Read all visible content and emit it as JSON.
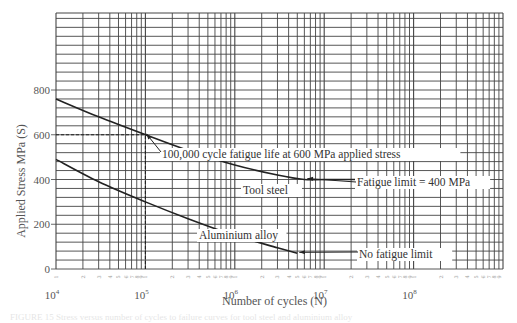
{
  "chart_data": {
    "type": "line",
    "title": "",
    "xlabel": "Number of cycles (N)",
    "ylabel": "Applied Stress MPa (S)",
    "x_scale": "log",
    "xlim": [
      10000,
      1000000000
    ],
    "ylim": [
      0,
      1140
    ],
    "grid": true,
    "x_tick_labels": [
      "10⁴",
      "10⁵",
      "10⁶",
      "10⁷",
      "10⁸"
    ],
    "x_tick_values": [
      10000,
      100000,
      1000000,
      10000000,
      100000000
    ],
    "y_tick_labels": [
      "0",
      "200",
      "400",
      "600",
      "800"
    ],
    "y_tick_values": [
      0,
      200,
      400,
      600,
      800
    ],
    "legend": null,
    "series": [
      {
        "name": "Tool steel",
        "x": [
          10000,
          30000,
          100000,
          300000,
          1000000,
          3000000,
          6000000,
          10000000,
          30000000,
          100000000,
          130000000
        ],
        "y": [
          760,
          680,
          600,
          530,
          465,
          420,
          400,
          400,
          400,
          400,
          400
        ]
      },
      {
        "name": "Aluminium alloy",
        "x": [
          10000,
          30000,
          100000,
          300000,
          1000000,
          3000000,
          5000000
        ],
        "y": [
          490,
          390,
          300,
          225,
          150,
          95,
          70
        ]
      }
    ],
    "annotations": [
      {
        "text": "100,000 cycle fatigue life at 600 MPa applied stress",
        "x": 100000,
        "y": 600
      },
      {
        "text": "Tool steel",
        "series": "Tool steel"
      },
      {
        "text": "Fatigue limit = 400 MPa",
        "x": 6000000,
        "y": 400
      },
      {
        "text": "Aluminium alloy",
        "series": "Aluminium alloy"
      },
      {
        "text": "No fatigue limit",
        "x": 5000000,
        "y": 70
      }
    ],
    "reference_lines": [
      {
        "type": "dashed",
        "orientation": "horizontal",
        "y": 600,
        "x_from": 10000,
        "x_to": 100000
      },
      {
        "type": "dashed",
        "orientation": "vertical",
        "x": 100000,
        "y_from": 0,
        "y_to": 600
      }
    ]
  },
  "labels": {
    "ylabel": "Applied Stress MPa (S)",
    "xlabel": "Number of cycles (N)",
    "ann_100k": "100,000 cycle fatigue life at 600 MPa applied stress",
    "ann_tool": "Tool steel",
    "ann_fatigue_limit": "Fatigue limit = 400 MPa",
    "ann_alu": "Aluminium alloy",
    "ann_no_limit": "No fatigue limit",
    "decade_base": "10",
    "decade_exp": [
      "4",
      "5",
      "6",
      "7",
      "8"
    ],
    "y_ticks": [
      "0",
      "200",
      "400",
      "600",
      "800"
    ],
    "minor_digits": [
      "2",
      "3",
      "4",
      "5",
      "6",
      "7",
      "8",
      "9"
    ]
  },
  "caption": "FIGURE 15  Stress versus number of cycles to failure curves for tool steel and aluminium alloy"
}
